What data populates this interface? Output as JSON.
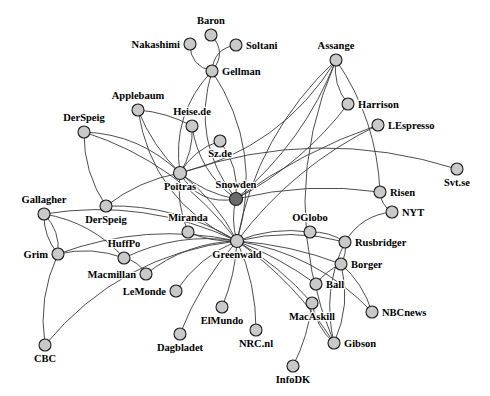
{
  "figure": {
    "type": "network-graph",
    "title": "",
    "width": 490,
    "height": 396,
    "background_color": "#ffffff"
  },
  "style": {
    "node_fill_default": "#c9c9c9",
    "node_fill_highlight": "#6a6a6a",
    "node_stroke": "#1a1a1a",
    "edge_color": "#3a3a3a",
    "label_color": "#000000",
    "node_radius_default": 6.0,
    "node_radius_hub": 6.5
  },
  "chart_data": {
    "type": "scatter",
    "title": "",
    "xlabel": "",
    "ylabel": "",
    "nodes": [
      {
        "id": "Baron",
        "label": "Baron",
        "x": 211,
        "y": 35,
        "r": 6.0,
        "highlight": false,
        "label_dx": 0,
        "label_dy": -11,
        "anchor": "middle"
      },
      {
        "id": "Nakashimi",
        "label": "Nakashimi",
        "x": 190,
        "y": 44,
        "r": 6.0,
        "highlight": false,
        "label_dx": -10,
        "label_dy": 4,
        "anchor": "end"
      },
      {
        "id": "Soltani",
        "label": "Soltani",
        "x": 236,
        "y": 45,
        "r": 6.0,
        "highlight": false,
        "label_dx": 10,
        "label_dy": 4,
        "anchor": "start"
      },
      {
        "id": "Gellman",
        "label": "Gellman",
        "x": 212,
        "y": 71,
        "r": 6.0,
        "highlight": false,
        "label_dx": 10,
        "label_dy": 4,
        "anchor": "start"
      },
      {
        "id": "Assange",
        "label": "Assange",
        "x": 336,
        "y": 60,
        "r": 6.0,
        "highlight": false,
        "label_dx": 0,
        "label_dy": -11,
        "anchor": "middle"
      },
      {
        "id": "Harrison",
        "label": "Harrison",
        "x": 348,
        "y": 104,
        "r": 6.0,
        "highlight": false,
        "label_dx": 10,
        "label_dy": 4,
        "anchor": "start"
      },
      {
        "id": "LEspresso",
        "label": "LEspresso",
        "x": 378,
        "y": 125,
        "r": 6.0,
        "highlight": false,
        "label_dx": 10,
        "label_dy": 4,
        "anchor": "start"
      },
      {
        "id": "Applebaum",
        "label": "Applebaum",
        "x": 138,
        "y": 110,
        "r": 6.0,
        "highlight": false,
        "label_dx": 0,
        "label_dy": -11,
        "anchor": "middle"
      },
      {
        "id": "Heise.de",
        "label": "Heise.de",
        "x": 192,
        "y": 126,
        "r": 6.0,
        "highlight": false,
        "label_dx": 0,
        "label_dy": -11,
        "anchor": "middle"
      },
      {
        "id": "DerSpeig1",
        "label": "DerSpeig",
        "x": 84,
        "y": 132,
        "r": 6.0,
        "highlight": false,
        "label_dx": 0,
        "label_dy": -11,
        "anchor": "middle"
      },
      {
        "id": "Sz.de",
        "label": "Sz.de",
        "x": 220,
        "y": 141,
        "r": 6.0,
        "highlight": false,
        "label_dx": 0,
        "label_dy": 16,
        "anchor": "middle"
      },
      {
        "id": "Svt.se",
        "label": "Svt.se",
        "x": 457,
        "y": 169,
        "r": 6.0,
        "highlight": false,
        "label_dx": 0,
        "label_dy": 17,
        "anchor": "middle"
      },
      {
        "id": "Poitras",
        "label": "Poitras",
        "x": 180,
        "y": 173,
        "r": 6.5,
        "highlight": false,
        "label_dx": 0,
        "label_dy": 17,
        "anchor": "middle"
      },
      {
        "id": "Snowden",
        "label": "Snowden",
        "x": 236,
        "y": 199,
        "r": 6.5,
        "highlight": true,
        "label_dx": 0,
        "label_dy": -11,
        "anchor": "middle"
      },
      {
        "id": "Risen",
        "label": "Risen",
        "x": 380,
        "y": 192,
        "r": 6.0,
        "highlight": false,
        "label_dx": 10,
        "label_dy": 4,
        "anchor": "start"
      },
      {
        "id": "NYT",
        "label": "NYT",
        "x": 392,
        "y": 212,
        "r": 6.0,
        "highlight": false,
        "label_dx": 10,
        "label_dy": 4,
        "anchor": "start"
      },
      {
        "id": "Gallagher",
        "label": "Gallagher",
        "x": 44,
        "y": 214,
        "r": 6.0,
        "highlight": false,
        "label_dx": 0,
        "label_dy": -11,
        "anchor": "middle"
      },
      {
        "id": "DerSpeig2",
        "label": "DerSpeig",
        "x": 106,
        "y": 206,
        "r": 6.0,
        "highlight": false,
        "label_dx": 0,
        "label_dy": 17,
        "anchor": "middle"
      },
      {
        "id": "Miranda",
        "label": "Miranda",
        "x": 188,
        "y": 232,
        "r": 6.0,
        "highlight": false,
        "label_dx": 0,
        "label_dy": -11,
        "anchor": "middle"
      },
      {
        "id": "OGlobo",
        "label": "OGlobo",
        "x": 310,
        "y": 232,
        "r": 6.0,
        "highlight": false,
        "label_dx": 0,
        "label_dy": -11,
        "anchor": "middle"
      },
      {
        "id": "Rusbridger",
        "label": "Rusbridger",
        "x": 345,
        "y": 242,
        "r": 6.0,
        "highlight": false,
        "label_dx": 10,
        "label_dy": 4,
        "anchor": "start"
      },
      {
        "id": "Greenwald",
        "label": "Greenwald",
        "x": 237,
        "y": 241,
        "r": 6.5,
        "highlight": false,
        "label_dx": 0,
        "label_dy": 17,
        "anchor": "middle"
      },
      {
        "id": "HuffPo",
        "label": "HuffPo",
        "x": 124,
        "y": 258,
        "r": 6.0,
        "highlight": false,
        "label_dx": 0,
        "label_dy": -11,
        "anchor": "middle"
      },
      {
        "id": "Grim",
        "label": "Grim",
        "x": 58,
        "y": 254,
        "r": 6.0,
        "highlight": false,
        "label_dx": -10,
        "label_dy": 4,
        "anchor": "end"
      },
      {
        "id": "Borger",
        "label": "Borger",
        "x": 341,
        "y": 264,
        "r": 6.0,
        "highlight": false,
        "label_dx": 10,
        "label_dy": 4,
        "anchor": "start"
      },
      {
        "id": "Macmillan",
        "label": "Macmillan",
        "x": 146,
        "y": 274,
        "r": 6.0,
        "highlight": false,
        "label_dx": -10,
        "label_dy": 4,
        "anchor": "end"
      },
      {
        "id": "Ball",
        "label": "Ball",
        "x": 316,
        "y": 284,
        "r": 6.0,
        "highlight": false,
        "label_dx": 10,
        "label_dy": 4,
        "anchor": "start"
      },
      {
        "id": "LeMonde",
        "label": "LeMonde",
        "x": 176,
        "y": 291,
        "r": 6.0,
        "highlight": false,
        "label_dx": -10,
        "label_dy": 4,
        "anchor": "end"
      },
      {
        "id": "MacAskill",
        "label": "MacAskill",
        "x": 312,
        "y": 303,
        "r": 6.0,
        "highlight": false,
        "label_dx": 0,
        "label_dy": 17,
        "anchor": "middle"
      },
      {
        "id": "NBCnews",
        "label": "NBCnews",
        "x": 372,
        "y": 312,
        "r": 6.0,
        "highlight": false,
        "label_dx": 10,
        "label_dy": 4,
        "anchor": "start"
      },
      {
        "id": "ElMundo",
        "label": "ElMundo",
        "x": 222,
        "y": 307,
        "r": 6.0,
        "highlight": false,
        "label_dx": 0,
        "label_dy": 17,
        "anchor": "middle"
      },
      {
        "id": "NRC.nl",
        "label": "NRC.nl",
        "x": 256,
        "y": 330,
        "r": 6.0,
        "highlight": false,
        "label_dx": 0,
        "label_dy": 17,
        "anchor": "middle"
      },
      {
        "id": "Gibson",
        "label": "Gibson",
        "x": 334,
        "y": 343,
        "r": 6.0,
        "highlight": false,
        "label_dx": 10,
        "label_dy": 4,
        "anchor": "start"
      },
      {
        "id": "Dagblade",
        "label": "Dagbladet",
        "x": 180,
        "y": 334,
        "r": 6.0,
        "highlight": false,
        "label_dx": 0,
        "label_dy": 17,
        "anchor": "middle"
      },
      {
        "id": "CBC",
        "label": "CBC",
        "x": 45,
        "y": 345,
        "r": 6.0,
        "highlight": false,
        "label_dx": 0,
        "label_dy": 17,
        "anchor": "middle"
      },
      {
        "id": "InfoDK",
        "label": "InfoDK",
        "x": 293,
        "y": 366,
        "r": 6.0,
        "highlight": false,
        "label_dx": 0,
        "label_dy": 17,
        "anchor": "middle"
      }
    ],
    "edges": [
      {
        "source": "Baron",
        "target": "Gellman",
        "curve": -16
      },
      {
        "source": "Nakashimi",
        "target": "Gellman",
        "curve": 14
      },
      {
        "source": "Soltani",
        "target": "Gellman",
        "curve": 14
      },
      {
        "source": "Gellman",
        "target": "Poitras",
        "curve": 26
      },
      {
        "source": "Gellman",
        "target": "Snowden",
        "curve": 34
      },
      {
        "source": "Gellman",
        "target": "Greenwald",
        "curve": -40
      },
      {
        "source": "Applebaum",
        "target": "Poitras",
        "curve": 8
      },
      {
        "source": "Applebaum",
        "target": "Heise.de",
        "curve": -6
      },
      {
        "source": "Applebaum",
        "target": "Greenwald",
        "curve": 44
      },
      {
        "source": "Heise.de",
        "target": "Poitras",
        "curve": -8
      },
      {
        "source": "Heise.de",
        "target": "Snowden",
        "curve": 18
      },
      {
        "source": "DerSpeig1",
        "target": "Poitras",
        "curve": -20
      },
      {
        "source": "DerSpeig1",
        "target": "Greenwald",
        "curve": -30
      },
      {
        "source": "DerSpeig1",
        "target": "DerSpeig2",
        "curve": 12
      },
      {
        "source": "Sz.de",
        "target": "Poitras",
        "curve": 10
      },
      {
        "source": "Sz.de",
        "target": "Snowden",
        "curve": -12
      },
      {
        "source": "Poitras",
        "target": "Snowden",
        "curve": 8
      },
      {
        "source": "Poitras",
        "target": "Greenwald",
        "curve": -10
      },
      {
        "source": "Poitras",
        "target": "Miranda",
        "curve": 8
      },
      {
        "source": "Poitras",
        "target": "Assange",
        "curve": 40
      },
      {
        "source": "Poitras",
        "target": "Svt.se",
        "curve": -46
      },
      {
        "source": "Snowden",
        "target": "Greenwald",
        "curve": 6
      },
      {
        "source": "Snowden",
        "target": "Assange",
        "curve": 22
      },
      {
        "source": "Snowden",
        "target": "Harrison",
        "curve": 16
      },
      {
        "source": "Snowden",
        "target": "LEspresso",
        "curve": -12
      },
      {
        "source": "Snowden",
        "target": "Risen",
        "curve": -14
      },
      {
        "source": "Snowden",
        "target": "Poitras",
        "curve": -22
      },
      {
        "source": "Assange",
        "target": "Harrison",
        "curve": 10
      },
      {
        "source": "Assange",
        "target": "Greenwald",
        "curve": 34
      },
      {
        "source": "Assange",
        "target": "Risen",
        "curve": -20
      },
      {
        "source": "Assange",
        "target": "Gibson",
        "curve": 60
      },
      {
        "source": "LEspresso",
        "target": "Greenwald",
        "curve": 22
      },
      {
        "source": "Risen",
        "target": "NYT",
        "curve": 6
      },
      {
        "source": "NYT",
        "target": "Rusbridger",
        "curve": 14
      },
      {
        "source": "Greenwald",
        "target": "Miranda",
        "curve": -6
      },
      {
        "source": "Greenwald",
        "target": "OGlobo",
        "curve": -10
      },
      {
        "source": "Greenwald",
        "target": "Rusbridger",
        "curve": -14
      },
      {
        "source": "Greenwald",
        "target": "Borger",
        "curve": -8
      },
      {
        "source": "Greenwald",
        "target": "Ball",
        "curve": -6
      },
      {
        "source": "Greenwald",
        "target": "MacAskill",
        "curve": -8
      },
      {
        "source": "Greenwald",
        "target": "Gibson",
        "curve": -14
      },
      {
        "source": "Greenwald",
        "target": "NBCnews",
        "curve": -26
      },
      {
        "source": "Greenwald",
        "target": "ElMundo",
        "curve": -6
      },
      {
        "source": "Greenwald",
        "target": "NRC.nl",
        "curve": -10
      },
      {
        "source": "Greenwald",
        "target": "Dagblade",
        "curve": 10
      },
      {
        "source": "Greenwald",
        "target": "LeMonde",
        "curve": 12
      },
      {
        "source": "Greenwald",
        "target": "Macmillan",
        "curve": 16
      },
      {
        "source": "Greenwald",
        "target": "HuffPo",
        "curve": 18
      },
      {
        "source": "Greenwald",
        "target": "DerSpeig2",
        "curve": 20
      },
      {
        "source": "Greenwald",
        "target": "Gallagher",
        "curve": 30
      },
      {
        "source": "Greenwald",
        "target": "CBC",
        "curve": 44
      },
      {
        "source": "Greenwald",
        "target": "Grim",
        "curve": 26
      },
      {
        "source": "OGlobo",
        "target": "Rusbridger",
        "curve": -6
      },
      {
        "source": "Rusbridger",
        "target": "Borger",
        "curve": -4
      },
      {
        "source": "Rusbridger",
        "target": "Gibson",
        "curve": 18
      },
      {
        "source": "Borger",
        "target": "Ball",
        "curve": 4
      },
      {
        "source": "Borger",
        "target": "NBCnews",
        "curve": -8
      },
      {
        "source": "Borger",
        "target": "Gibson",
        "curve": -14
      },
      {
        "source": "MacAskill",
        "target": "Gibson",
        "curve": 8
      },
      {
        "source": "MacAskill",
        "target": "InfoDK",
        "curve": -6
      },
      {
        "source": "Gallagher",
        "target": "Grim",
        "curve": -10
      },
      {
        "source": "Gallagher",
        "target": "Grim",
        "curve": 8
      },
      {
        "source": "Gallagher",
        "target": "HuffPo",
        "curve": -16
      },
      {
        "source": "Grim",
        "target": "HuffPo",
        "curve": -10
      },
      {
        "source": "Grim",
        "target": "CBC",
        "curve": 14
      },
      {
        "source": "HuffPo",
        "target": "Macmillan",
        "curve": -6
      },
      {
        "source": "DerSpeig2",
        "target": "Poitras",
        "curve": -10
      }
    ]
  }
}
